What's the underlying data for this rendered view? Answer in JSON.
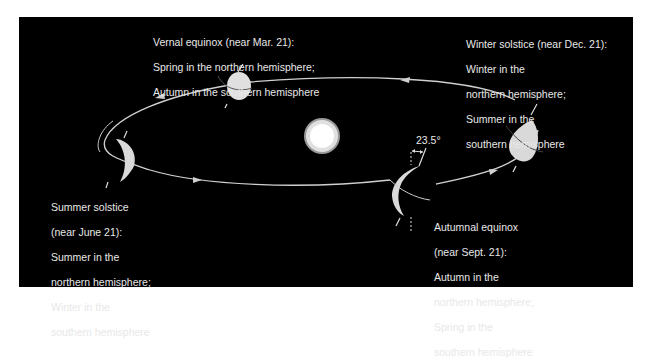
{
  "diagram": {
    "colors": {
      "background": "#000000",
      "page": "#ffffff",
      "orbit": "#d8d8d8",
      "earth": "#d9d9d9",
      "sun_core": "#ffffff",
      "sun_ring": "#bdbdbd",
      "text": "#e8e8e8"
    },
    "sun": {
      "label": ""
    },
    "tilt_angle": "23.5°",
    "positions": [
      {
        "id": "vernal",
        "lines": [
          "Vernal equinox (near Mar. 21):",
          "Spring in the northern hemisphere;",
          "Autumn in the southern hemisphere"
        ]
      },
      {
        "id": "winter",
        "lines": [
          "Winter solstice (near Dec. 21):",
          "Winter in the",
          "northern hemisphere;",
          "Summer in the",
          "southern hemisphere"
        ]
      },
      {
        "id": "summer",
        "lines": [
          "Summer solstice",
          "(near June 21):",
          "Summer in the",
          "northern hemisphere;",
          "Winter in the",
          "southern hemisphere"
        ]
      },
      {
        "id": "autumnal",
        "lines": [
          "Autumnal equinox",
          "(near Sept. 21):",
          "Autumn in the",
          "northern hemisphere;",
          "Spring in the",
          "southern hemisphere"
        ]
      }
    ]
  }
}
